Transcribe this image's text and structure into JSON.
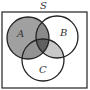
{
  "diagram": {
    "type": "venn",
    "universe_label": "S",
    "sets": [
      {
        "name": "A",
        "label": "A"
      },
      {
        "name": "B",
        "label": "B"
      },
      {
        "name": "C",
        "label": "C"
      }
    ],
    "shaded_regions": [
      "A",
      "B∩C"
    ],
    "colors": {
      "outline": "#222222",
      "shade_light": "#c8c8c8",
      "shade_medium": "#a0a0a0",
      "shade_dark": "#7a7a7a",
      "shade_darkest": "#5e5e5e",
      "background": "#ffffff"
    }
  }
}
